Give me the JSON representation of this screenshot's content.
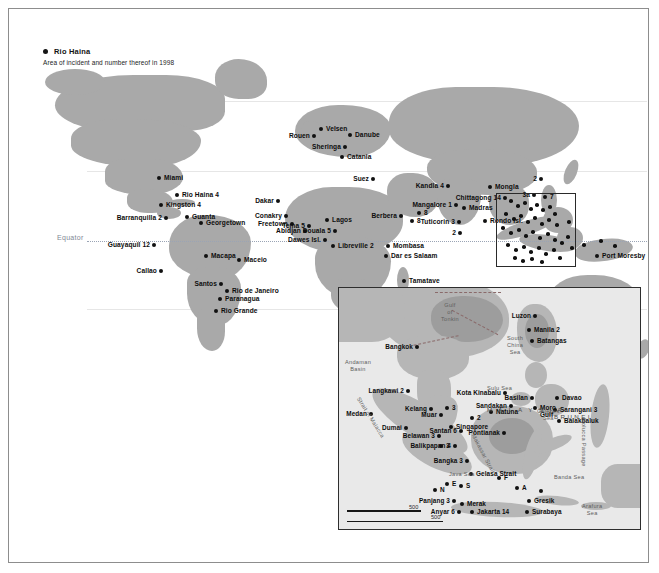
{
  "legend": {
    "sample_label": "Rio Haina",
    "caption": "Area of incident and number thereof in 1998"
  },
  "main_map": {
    "equator_label": "Equator",
    "points": [
      {
        "name": "Miami",
        "label": "Miami",
        "x": 150,
        "y": 169,
        "side": "right"
      },
      {
        "name": "Rio Haina",
        "label": "Rio Haina 4",
        "x": 168,
        "y": 186,
        "side": "right"
      },
      {
        "name": "Kingston",
        "label": "Kingston 4",
        "x": 152,
        "y": 196,
        "side": "right"
      },
      {
        "name": "Barranquilla",
        "label": "Barranquilla 2",
        "x": 157,
        "y": 209,
        "side": "left"
      },
      {
        "name": "Guanta",
        "label": "Guanta",
        "x": 178,
        "y": 208,
        "side": "right"
      },
      {
        "name": "Georgetown",
        "label": "Georgetown",
        "x": 192,
        "y": 214,
        "side": "right"
      },
      {
        "name": "Guayaquil",
        "label": "Guayaquil 12",
        "x": 145,
        "y": 236,
        "side": "left"
      },
      {
        "name": "Macapa",
        "label": "Macapa",
        "x": 197,
        "y": 247,
        "side": "right"
      },
      {
        "name": "Callao",
        "label": "Callao",
        "x": 152,
        "y": 262,
        "side": "left"
      },
      {
        "name": "Maceio",
        "label": "Maceio",
        "x": 230,
        "y": 251,
        "side": "right"
      },
      {
        "name": "Santos",
        "label": "Santos",
        "x": 212,
        "y": 275,
        "side": "left"
      },
      {
        "name": "Rio de Janeiro",
        "label": "Rio de Janeiro",
        "x": 218,
        "y": 282,
        "side": "right"
      },
      {
        "name": "Paranagua",
        "label": "Paranagua",
        "x": 211,
        "y": 290,
        "side": "right"
      },
      {
        "name": "Rio Grande",
        "label": "Rio Grande",
        "x": 207,
        "y": 302,
        "side": "right"
      },
      {
        "name": "Velsen",
        "label": "Velsen",
        "x": 312,
        "y": 120,
        "side": "right"
      },
      {
        "name": "Rouen",
        "label": "Rouen",
        "x": 305,
        "y": 127,
        "side": "left"
      },
      {
        "name": "Danube",
        "label": "Danube",
        "x": 341,
        "y": 126,
        "side": "right"
      },
      {
        "name": "Sheringa",
        "label": "Sheringa",
        "x": 336,
        "y": 138,
        "side": "left"
      },
      {
        "name": "Catania",
        "label": "Catania",
        "x": 333,
        "y": 148,
        "side": "right"
      },
      {
        "name": "Suez",
        "label": "Suez",
        "x": 364,
        "y": 170,
        "side": "left"
      },
      {
        "name": "Dakar",
        "label": "Dakar",
        "x": 269,
        "y": 192,
        "side": "left"
      },
      {
        "name": "Conakry",
        "label": "Conakry",
        "x": 277,
        "y": 207,
        "side": "left"
      },
      {
        "name": "Freetown",
        "label": "Freetown",
        "x": 283,
        "y": 215,
        "side": "left"
      },
      {
        "name": "Abidjan",
        "label": "Abidjan",
        "x": 296,
        "y": 222,
        "side": "left"
      },
      {
        "name": "Tema",
        "label": "Tema 5",
        "x": 300,
        "y": 217,
        "side": "left"
      },
      {
        "name": "Lagos",
        "label": "Lagos",
        "x": 318,
        "y": 211,
        "side": "right"
      },
      {
        "name": "Douala",
        "label": "Douala 5",
        "x": 326,
        "y": 222,
        "side": "left"
      },
      {
        "name": "Dawes Isl.",
        "label": "Dawes Isl.",
        "x": 316,
        "y": 231,
        "side": "left"
      },
      {
        "name": "Libreville",
        "label": "Libreville 2",
        "x": 324,
        "y": 237,
        "side": "right"
      },
      {
        "name": "Berbera",
        "label": "Berbera",
        "x": 392,
        "y": 207,
        "side": "left"
      },
      {
        "name": "Somalia 8",
        "label": "8",
        "x": 403,
        "y": 212,
        "side": "right"
      },
      {
        "name": "Mombasa",
        "label": "Mombasa",
        "x": 379,
        "y": 237,
        "side": "right"
      },
      {
        "name": "Dar es Salaam",
        "label": "Dar es Salaam",
        "x": 377,
        "y": 247,
        "side": "right"
      },
      {
        "name": "Tamatave",
        "label": "Tamatave",
        "x": 395,
        "y": 272,
        "side": "right"
      },
      {
        "name": "Kandla",
        "label": "Kandla 4",
        "x": 439,
        "y": 177,
        "side": "left"
      },
      {
        "name": "Mangalore",
        "label": "Mangalore 1",
        "x": 447,
        "y": 196,
        "side": "left"
      },
      {
        "name": "India 8",
        "label": "8",
        "x": 410,
        "y": 204,
        "side": "right"
      },
      {
        "name": "Tuticorin",
        "label": "Tuticorin 3",
        "x": 450,
        "y": 213,
        "side": "left"
      },
      {
        "name": "Madras",
        "label": "Madras",
        "x": 455,
        "y": 199,
        "side": "right"
      },
      {
        "name": "Lanka 2",
        "label": "2",
        "x": 451,
        "y": 224,
        "side": "left"
      },
      {
        "name": "Mongla",
        "label": "Mongla",
        "x": 481,
        "y": 178,
        "side": "right"
      },
      {
        "name": "Chittagong",
        "label": "Chittagong 14",
        "x": 496,
        "y": 189,
        "side": "left"
      },
      {
        "name": "Rondo Isl.",
        "label": "Rondo Isl.",
        "x": 476,
        "y": 212,
        "side": "right"
      },
      {
        "name": "SCS 2",
        "label": "2",
        "x": 532,
        "y": 170,
        "side": "left"
      },
      {
        "name": "SCS 3a",
        "label": "3a",
        "x": 525,
        "y": 186,
        "side": "left"
      },
      {
        "name": "SCS 7",
        "label": "7",
        "x": 536,
        "y": 188,
        "side": "right"
      },
      {
        "name": "Port Moresby",
        "label": "Port Moresby",
        "x": 588,
        "y": 247,
        "side": "right"
      }
    ],
    "cluster_points": [
      {
        "x": 502,
        "y": 192
      },
      {
        "x": 509,
        "y": 197
      },
      {
        "x": 516,
        "y": 194
      },
      {
        "x": 522,
        "y": 200
      },
      {
        "x": 528,
        "y": 196
      },
      {
        "x": 534,
        "y": 201
      },
      {
        "x": 541,
        "y": 198
      },
      {
        "x": 546,
        "y": 205
      },
      {
        "x": 497,
        "y": 205
      },
      {
        "x": 505,
        "y": 210
      },
      {
        "x": 512,
        "y": 207
      },
      {
        "x": 519,
        "y": 213
      },
      {
        "x": 526,
        "y": 209
      },
      {
        "x": 533,
        "y": 215
      },
      {
        "x": 540,
        "y": 211
      },
      {
        "x": 548,
        "y": 216
      },
      {
        "x": 494,
        "y": 219
      },
      {
        "x": 502,
        "y": 224
      },
      {
        "x": 510,
        "y": 221
      },
      {
        "x": 517,
        "y": 227
      },
      {
        "x": 524,
        "y": 223
      },
      {
        "x": 531,
        "y": 229
      },
      {
        "x": 539,
        "y": 225
      },
      {
        "x": 546,
        "y": 231
      },
      {
        "x": 499,
        "y": 236
      },
      {
        "x": 507,
        "y": 241
      },
      {
        "x": 515,
        "y": 238
      },
      {
        "x": 522,
        "y": 243
      },
      {
        "x": 530,
        "y": 239
      },
      {
        "x": 537,
        "y": 245
      },
      {
        "x": 545,
        "y": 241
      },
      {
        "x": 553,
        "y": 234
      },
      {
        "x": 506,
        "y": 249
      },
      {
        "x": 514,
        "y": 252
      },
      {
        "x": 523,
        "y": 250
      },
      {
        "x": 533,
        "y": 253
      },
      {
        "x": 559,
        "y": 228
      },
      {
        "x": 563,
        "y": 239
      },
      {
        "x": 551,
        "y": 249
      },
      {
        "x": 560,
        "y": 213
      },
      {
        "x": 575,
        "y": 236
      },
      {
        "x": 592,
        "y": 232
      },
      {
        "x": 606,
        "y": 237
      }
    ]
  },
  "inset_map": {
    "scale_top": "500",
    "scale_bottom": "500",
    "water_labels": [
      {
        "name": "Gulf of Tonkin",
        "text": "Gulf\nof\nTonkin",
        "x": 102,
        "y": 14
      },
      {
        "name": "South China Sea",
        "text": "South\nChina\nSea",
        "x": 168,
        "y": 47
      },
      {
        "name": "Andaman Basin",
        "text": "Andaman\nBasin",
        "x": 6,
        "y": 71
      },
      {
        "name": "Sulu Sea",
        "text": "Sulu Sea",
        "x": 148,
        "y": 97
      },
      {
        "name": "Celebes Sea",
        "text": "Celebes\nSea",
        "x": 198,
        "y": 120
      },
      {
        "name": "Java Sea",
        "text": "Java Sea",
        "x": 110,
        "y": 183
      },
      {
        "name": "Banda Sea",
        "text": "Banda Sea",
        "x": 215,
        "y": 186
      },
      {
        "name": "Arafura Sea",
        "text": "Arafura\nSea",
        "x": 243,
        "y": 215
      },
      {
        "name": "Makassar Strait",
        "text": "Makassar Strait",
        "x": 137,
        "y": 145
      },
      {
        "name": "Molucca Passage",
        "text": "Molucca Passage",
        "x": 248,
        "y": 130
      },
      {
        "name": "Strait of Malacca",
        "text": "Strait of Malacca",
        "x": 22,
        "y": 108
      }
    ],
    "region_labels": [
      {
        "name": "Malaysia",
        "text": "M A L A Y S I A",
        "x": 148,
        "y": 118
      },
      {
        "name": "Brunei",
        "text": "BRUNEI",
        "x": 215,
        "y": 125
      }
    ],
    "points": [
      {
        "name": "Bangkok",
        "label": "Bangkok",
        "x": 78,
        "y": 59,
        "side": "left"
      },
      {
        "name": "Langkawi",
        "label": "Langkawi 2",
        "x": 69,
        "y": 103,
        "side": "left"
      },
      {
        "name": "Kelang",
        "label": "Kelang",
        "x": 92,
        "y": 121,
        "side": "left"
      },
      {
        "name": "Medan",
        "label": "Medan",
        "x": 32,
        "y": 126,
        "side": "left"
      },
      {
        "name": "Muar",
        "label": "Muar",
        "x": 102,
        "y": 127,
        "side": "left"
      },
      {
        "name": "Malacca 3",
        "label": "3",
        "x": 108,
        "y": 120,
        "side": "right"
      },
      {
        "name": "Dumai",
        "label": "Dumai",
        "x": 67,
        "y": 140,
        "side": "left"
      },
      {
        "name": "Singapore",
        "label": "Singapore",
        "x": 112,
        "y": 139,
        "side": "right"
      },
      {
        "name": "Belawan",
        "label": "Belawan 3",
        "x": 100,
        "y": 148,
        "side": "left"
      },
      {
        "name": "Riau 3",
        "label": "3",
        "x": 102,
        "y": 158,
        "side": "right"
      },
      {
        "name": "Natuna",
        "label": "Natuna",
        "x": 152,
        "y": 124,
        "side": "right"
      },
      {
        "name": "Pontianak",
        "label": "Pontianak",
        "x": 165,
        "y": 145,
        "side": "left"
      },
      {
        "name": "Bangka",
        "label": "Bangka 3",
        "x": 128,
        "y": 173,
        "side": "left"
      },
      {
        "name": "Gelasa Strait",
        "label": "Gelasa Strait",
        "x": 132,
        "y": 186,
        "side": "right"
      },
      {
        "name": "Panjang",
        "label": "Panjang 3",
        "x": 115,
        "y": 213,
        "side": "left"
      },
      {
        "name": "Merak",
        "label": "Merak",
        "x": 123,
        "y": 216,
        "side": "right"
      },
      {
        "name": "Anyar",
        "label": "Anyar 6",
        "x": 120,
        "y": 224,
        "side": "left"
      },
      {
        "name": "Jakarta",
        "label": "Jakarta 14",
        "x": 133,
        "y": 224,
        "side": "right"
      },
      {
        "name": "Gresik",
        "label": "Gresik",
        "x": 190,
        "y": 213,
        "side": "right"
      },
      {
        "name": "Surabaya",
        "label": "Surabaya",
        "x": 188,
        "y": 224,
        "side": "right"
      },
      {
        "name": "Luzon",
        "label": "Luzon",
        "x": 196,
        "y": 28,
        "side": "left"
      },
      {
        "name": "Manila",
        "label": "Manila 2",
        "x": 190,
        "y": 42,
        "side": "right"
      },
      {
        "name": "Batangas",
        "label": "Batangas",
        "x": 193,
        "y": 53,
        "side": "right"
      },
      {
        "name": "Basilan",
        "label": "Basilan",
        "x": 193,
        "y": 110,
        "side": "left"
      },
      {
        "name": "Sandakan",
        "label": "Sandakan",
        "x": 172,
        "y": 118,
        "side": "left"
      },
      {
        "name": "Kota Kinabalu",
        "label": "Kota Kinabalu",
        "x": 166,
        "y": 105,
        "side": "left"
      },
      {
        "name": "Moro Gulf",
        "label": "Moro\nGulf",
        "x": 196,
        "y": 120,
        "side": "right"
      },
      {
        "name": "Davao",
        "label": "Davao",
        "x": 218,
        "y": 110,
        "side": "right"
      },
      {
        "name": "Sarangani",
        "label": "Sarangani 3",
        "x": 216,
        "y": 122,
        "side": "right"
      },
      {
        "name": "Balakbaluk",
        "label": "Balakbaluk",
        "x": 220,
        "y": 133,
        "side": "right"
      },
      {
        "name": "Santan",
        "label": "Santan 6",
        "x": 122,
        "y": 143,
        "side": "left"
      },
      {
        "name": "Balikpapan",
        "label": "Balikpapan 4",
        "x": 116,
        "y": 158,
        "side": "left"
      },
      {
        "name": "Makassar 2",
        "label": "2",
        "x": 133,
        "y": 130,
        "side": "right"
      },
      {
        "name": "Java E",
        "label": "E",
        "x": 108,
        "y": 196,
        "side": "right"
      },
      {
        "name": "Java S",
        "label": "S",
        "x": 122,
        "y": 198,
        "side": "right"
      },
      {
        "name": "Flores F",
        "label": "F",
        "x": 160,
        "y": 190,
        "side": "right"
      },
      {
        "name": "Flores A",
        "label": "A",
        "x": 178,
        "y": 200,
        "side": "right"
      },
      {
        "name": "Banda pt",
        "label": "",
        "x": 202,
        "y": 203,
        "side": "right"
      },
      {
        "name": "Java N",
        "label": "N",
        "x": 96,
        "y": 202,
        "side": "right"
      }
    ]
  }
}
